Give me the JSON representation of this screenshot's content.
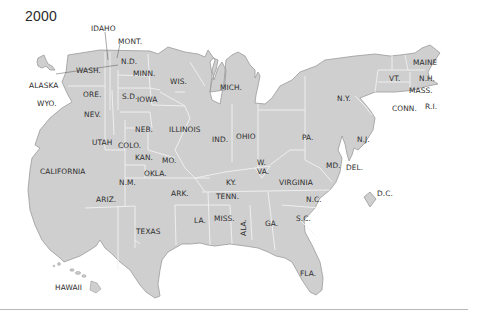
{
  "title": {
    "year": "2000"
  },
  "colors": {
    "land": "#cfcfcf",
    "border": "#9a9a9a",
    "inner_border": "#f2f2f2",
    "text": "#2d2d2d",
    "rule": "#b8b8b8"
  },
  "labels": {
    "idaho": "IDAHO",
    "mont": "MONT.",
    "wash": "WASH.",
    "nd": "N.D.",
    "minn": "MINN.",
    "wis": "WIS.",
    "mich": "MICH.",
    "alaska": "ALASKA",
    "ore": "ORE.",
    "sd": "S.D.",
    "iowa": "IOWA",
    "wyo": "WYO.",
    "nev": "NEV.",
    "neb": "NEB.",
    "illinois": "ILLINOIS",
    "utah": "UTAH",
    "colo": "COLO.",
    "kan": "KAN.",
    "mo": "MO.",
    "ind": "IND.",
    "ohio": "OHIO",
    "pa": "PA.",
    "ny": "N.Y.",
    "nj": "N.J.",
    "maine": "MAINE",
    "vt": "VT.",
    "nh": "N.H.",
    "mass": "MASS.",
    "conn": "CONN.",
    "ri": "R.I.",
    "california": "CALIFORNIA",
    "nm": "N.M.",
    "okla": "OKLA.",
    "ark": "ARK.",
    "ky": "KY.",
    "wva_w": "W.",
    "wva_va": "VA.",
    "virginia": "VIRGINIA",
    "md": "MD.",
    "del": "DEL.",
    "dc": "D.C.",
    "ariz": "ARIZ.",
    "tenn": "TENN.",
    "nc": "N.C.",
    "texas": "TEXAS",
    "la": "LA.",
    "miss": "MISS.",
    "ala": "ALA.",
    "ga": "GA.",
    "sc": "S.C.",
    "fla": "FLA.",
    "hawaii": "HAWAII"
  }
}
